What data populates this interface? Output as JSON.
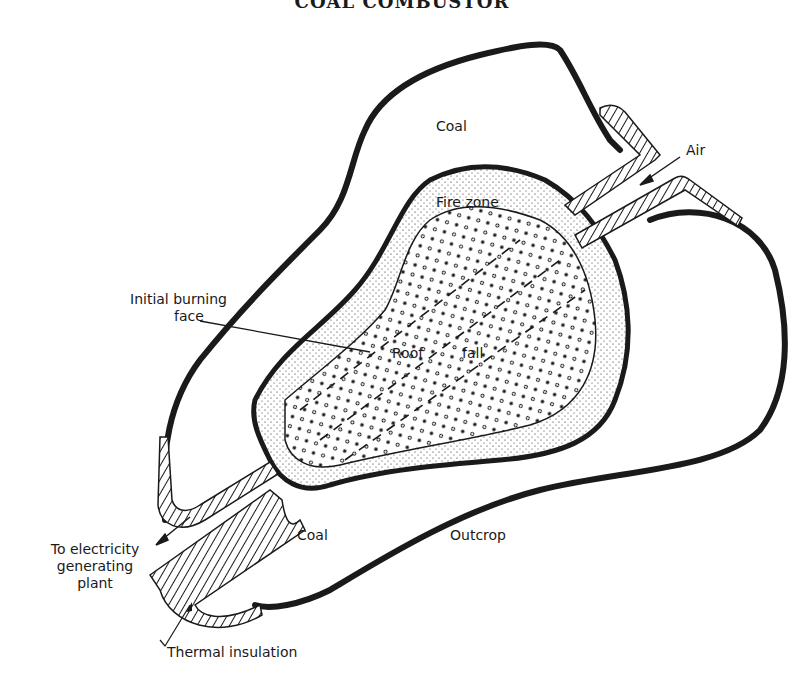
{
  "title": "COAL COMBUSTOR",
  "labels": {
    "coal_top": "Coal",
    "air": "Air",
    "fire_zone": "Fire zone",
    "initial_burning_line1": "Initial burning",
    "initial_burning_line2": "face",
    "roof": "Roof",
    "fall": "fall",
    "coal_bottom": "Coal",
    "outcrop": "Outcrop",
    "electricity_line1": "To electricity",
    "electricity_line2": "generating",
    "electricity_line3": "plant",
    "thermal_insulation": "Thermal insulation"
  },
  "colors": {
    "ink": "#1a1a1a",
    "background": "#ffffff"
  }
}
